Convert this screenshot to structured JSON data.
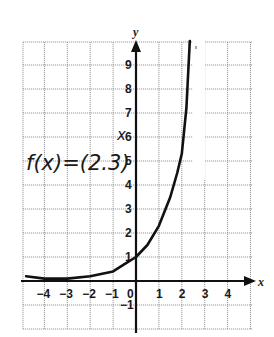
{
  "chart_data": {
    "type": "line",
    "title": "",
    "annotation": "f(x)=(2.3)^x",
    "annotation_parts": {
      "base": "f(x)=(2.3)",
      "exponent": "x"
    },
    "xlabel": "x",
    "ylabel": "y",
    "xlim": [
      -5,
      5
    ],
    "ylim": [
      -2,
      10
    ],
    "grid": true,
    "legend": null,
    "x_ticks": [
      "-4",
      "-3",
      "-2",
      "-1",
      "0",
      "1",
      "2",
      "3",
      "4"
    ],
    "y_ticks": [
      "-1",
      "1",
      "2",
      "3",
      "4",
      "5",
      "6",
      "7",
      "8",
      "9"
    ],
    "series": [
      {
        "name": "f(x)=(2.3)^x",
        "x": [
          -4.8,
          -4,
          -3,
          -2,
          -1,
          -0.5,
          0,
          0.5,
          1,
          1.5,
          1.8,
          2,
          2.2,
          2.35
        ],
        "y": [
          0.2,
          0.1,
          0.1,
          0.2,
          0.4,
          0.7,
          1.0,
          1.5,
          2.3,
          3.5,
          4.5,
          5.3,
          7.2,
          10
        ]
      }
    ]
  }
}
